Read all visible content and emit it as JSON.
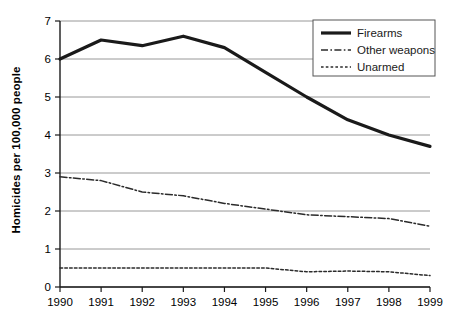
{
  "chart_data": {
    "type": "line",
    "title": "",
    "xlabel": "",
    "ylabel": "Homicides per 100,000 people",
    "x": [
      1990,
      1991,
      1992,
      1993,
      1994,
      1995,
      1996,
      1997,
      1998,
      1999
    ],
    "xtick_labels": [
      "1990",
      "1991",
      "1992",
      "1993",
      "1994",
      "1995",
      "1996",
      "1997",
      "1998",
      "1999"
    ],
    "ytick_labels": [
      "0",
      "1",
      "2",
      "3",
      "4",
      "5",
      "6",
      "7"
    ],
    "yticks": [
      0,
      1,
      2,
      3,
      4,
      5,
      6,
      7
    ],
    "ylim": [
      0,
      7
    ],
    "xlim": [
      1990,
      1999
    ],
    "grid": true,
    "grid_axis": "y",
    "legend_position": "top-right",
    "series": [
      {
        "name": "Firearms",
        "style": "solid",
        "color": "#1a1a1a",
        "width": 3.2,
        "values": [
          6.0,
          6.5,
          6.35,
          6.6,
          6.3,
          5.65,
          5.0,
          4.4,
          4.0,
          3.7
        ]
      },
      {
        "name": "Other weapons",
        "style": "dash-dot",
        "color": "#2b2b2b",
        "width": 1.5,
        "values": [
          2.9,
          2.8,
          2.5,
          2.4,
          2.2,
          2.05,
          1.9,
          1.85,
          1.8,
          1.6
        ]
      },
      {
        "name": "Unarmed",
        "style": "dotted",
        "color": "#2b2b2b",
        "width": 1.5,
        "values": [
          0.5,
          0.5,
          0.5,
          0.5,
          0.5,
          0.5,
          0.4,
          0.42,
          0.4,
          0.3
        ]
      }
    ]
  },
  "legend": {
    "items": [
      {
        "label": "Firearms"
      },
      {
        "label": "Other weapons"
      },
      {
        "label": "Unarmed"
      }
    ]
  },
  "axes": {
    "y_axis_title": "Homicides per 100,000 people"
  }
}
